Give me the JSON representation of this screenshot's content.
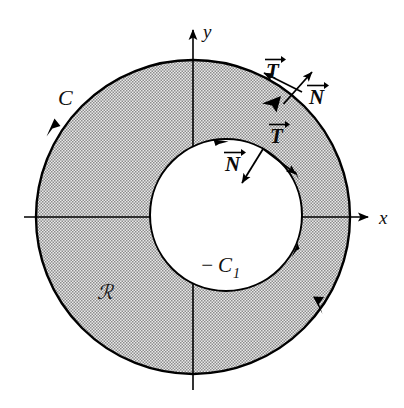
{
  "figure": {
    "background_color": "#ffffff",
    "stroke_color": "#000000",
    "region_fill_color": "#b4b4b4",
    "hole_fill_color": "#ffffff"
  },
  "axes": {
    "x_label": "x",
    "y_label": "y",
    "origin_x": 193,
    "origin_y": 217
  },
  "curves": {
    "outer": {
      "label": "C",
      "orientation": "counterclockwise",
      "center_x": 193,
      "center_y": 217,
      "radius": 157
    },
    "inner": {
      "label_minus": "−",
      "label_c": "C",
      "label_sub": "1",
      "label_full": "−C₁",
      "orientation": "clockwise",
      "center_x": 226,
      "center_y": 215,
      "radius": 76
    }
  },
  "region": {
    "label": "ℛ"
  },
  "vectors": {
    "outer_tangent": {
      "label_letter": "T",
      "arrow_accent": "→"
    },
    "outer_normal": {
      "label_letter": "N",
      "arrow_accent": "→"
    },
    "inner_tangent": {
      "label_letter": "T",
      "arrow_accent": "→"
    },
    "inner_normal": {
      "label_letter": "N",
      "arrow_accent": "→"
    }
  }
}
